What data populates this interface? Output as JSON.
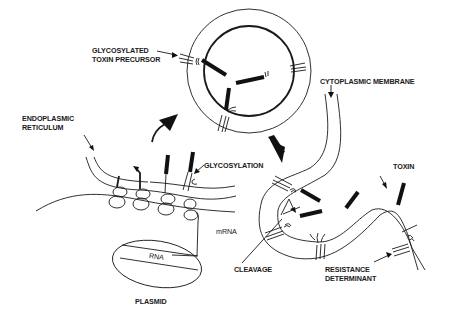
{
  "diagram": {
    "type": "biological process schematic",
    "colors": {
      "ink": "#1a1a1a",
      "background": "#ffffff"
    },
    "labels": {
      "glycosylated_precursor_line1": "GLYCOSYLATED",
      "glycosylated_precursor_line2": "TOXIN PRECURSOR",
      "endoplasmic_line1": "ENDOPLASMIC",
      "endoplasmic_line2": "RETICULUM",
      "glycosylation": "GLYCOSYLATION",
      "cytoplasmic_membrane": "CYTOPLASMIC MEMBRANE",
      "toxin": "TOXIN",
      "mrna": "mRNA",
      "rna": "RNA",
      "plasmid": "PLASMID",
      "cleavage": "CLEAVAGE",
      "resistance_line1": "RESISTANCE",
      "resistance_line2": "DETERMINANT"
    },
    "nodes": [
      {
        "id": "plasmid",
        "label": "PLASMID",
        "contains": "RNA"
      },
      {
        "id": "mrna",
        "label": "mRNA"
      },
      {
        "id": "er",
        "label": "ENDOPLASMIC RETICULUM"
      },
      {
        "id": "glycosylation",
        "label": "GLYCOSYLATION"
      },
      {
        "id": "vesicle",
        "label": "GLYCOSYLATED TOXIN PRECURSOR"
      },
      {
        "id": "membrane",
        "label": "CYTOPLASMIC MEMBRANE"
      },
      {
        "id": "cleavage",
        "label": "CLEAVAGE"
      },
      {
        "id": "toxin",
        "label": "TOXIN"
      },
      {
        "id": "resistance",
        "label": "RESISTANCE DETERMINANT"
      }
    ],
    "edges": [
      {
        "from": "plasmid",
        "to": "mrna"
      },
      {
        "from": "mrna",
        "to": "er"
      },
      {
        "from": "er",
        "to": "vesicle",
        "style": "bold-arrow"
      },
      {
        "from": "vesicle",
        "to": "membrane",
        "style": "bold-arrow"
      },
      {
        "from": "membrane",
        "to": "toxin"
      }
    ]
  }
}
